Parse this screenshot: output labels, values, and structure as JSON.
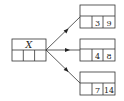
{
  "diagram": {
    "source_node": {
      "label": "X",
      "cells": [
        "",
        "",
        ""
      ]
    },
    "target_nodes": [
      {
        "header": "",
        "cells": [
          "",
          "3",
          "9"
        ]
      },
      {
        "header": "",
        "cells": [
          "",
          "4",
          "8"
        ]
      },
      {
        "header": "",
        "cells": [
          "",
          "7",
          "14"
        ]
      }
    ],
    "colors": {
      "stroke": "#333333",
      "background": "#ffffff"
    }
  }
}
